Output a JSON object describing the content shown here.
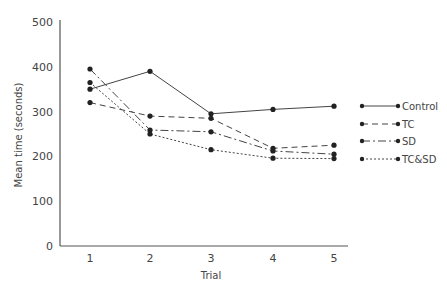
{
  "chart_data": {
    "type": "line",
    "title": "",
    "xlabel": "Trial",
    "ylabel": "Mean time (seconds)",
    "x": [
      1,
      2,
      3,
      4,
      5
    ],
    "categories": [
      "1",
      "2",
      "3",
      "4",
      "5"
    ],
    "yticks": [
      0,
      100,
      200,
      300,
      400,
      500
    ],
    "ylim": [
      0,
      500
    ],
    "grid": false,
    "legend_position": "right",
    "series": [
      {
        "name": "Control",
        "style": "solid",
        "values": [
          350,
          390,
          295,
          305,
          312
        ]
      },
      {
        "name": "TC",
        "style": "dashed",
        "values": [
          320,
          290,
          285,
          218,
          225
        ]
      },
      {
        "name": "SD",
        "style": "dash-dot",
        "values": [
          395,
          259,
          255,
          212,
          205
        ]
      },
      {
        "name": "TC&SD",
        "style": "dotted",
        "values": [
          365,
          250,
          215,
          196,
          195
        ]
      }
    ]
  }
}
